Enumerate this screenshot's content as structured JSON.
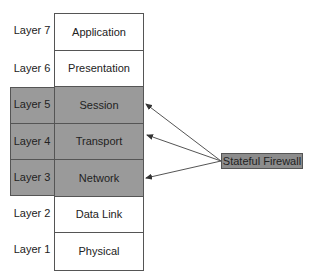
{
  "diagram": {
    "layers": [
      {
        "number": "Layer 7",
        "name": "Application",
        "highlighted": false
      },
      {
        "number": "Layer 6",
        "name": "Presentation",
        "highlighted": false
      },
      {
        "number": "Layer 5",
        "name": "Session",
        "highlighted": true
      },
      {
        "number": "Layer 4",
        "name": "Transport",
        "highlighted": true
      },
      {
        "number": "Layer 3",
        "name": "Network",
        "highlighted": true
      },
      {
        "number": "Layer 2",
        "name": "Data Link",
        "highlighted": false
      },
      {
        "number": "Layer 1",
        "name": "Physical",
        "highlighted": false
      }
    ],
    "callout": {
      "label": "Stateful Firewall",
      "targets": [
        "Session",
        "Transport",
        "Network"
      ]
    },
    "colors": {
      "highlight": "#9a9a9a",
      "callout": "#8c8c8c",
      "line": "#555555"
    }
  }
}
